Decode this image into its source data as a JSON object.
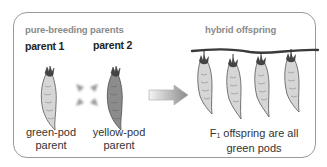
{
  "diagram": {
    "left_section": {
      "heading": "pure-breeding parents",
      "parent1": {
        "label": "parent 1",
        "caption_line1": "green-pod",
        "caption_line2": "parent",
        "pod_color": "#d6d6d6"
      },
      "parent2": {
        "label": "parent 2",
        "caption_line1": "yellow-pod",
        "caption_line2": "parent",
        "pod_color": "#8c8c8c"
      },
      "cross_symbol": "cross-icon"
    },
    "arrow": "right-arrow-icon",
    "right_section": {
      "heading": "hybrid offspring",
      "caption_prefix": "F",
      "caption_subscript": "1",
      "caption_line1_rest": " offspring are all",
      "caption_line2": "green pods",
      "pod_count": 4,
      "pod_color": "#d6d6d6"
    },
    "colors": {
      "border": "#9a9a9a",
      "heading": "#8a8a8a",
      "text": "#222222",
      "stem": "#3a3a3a"
    }
  }
}
